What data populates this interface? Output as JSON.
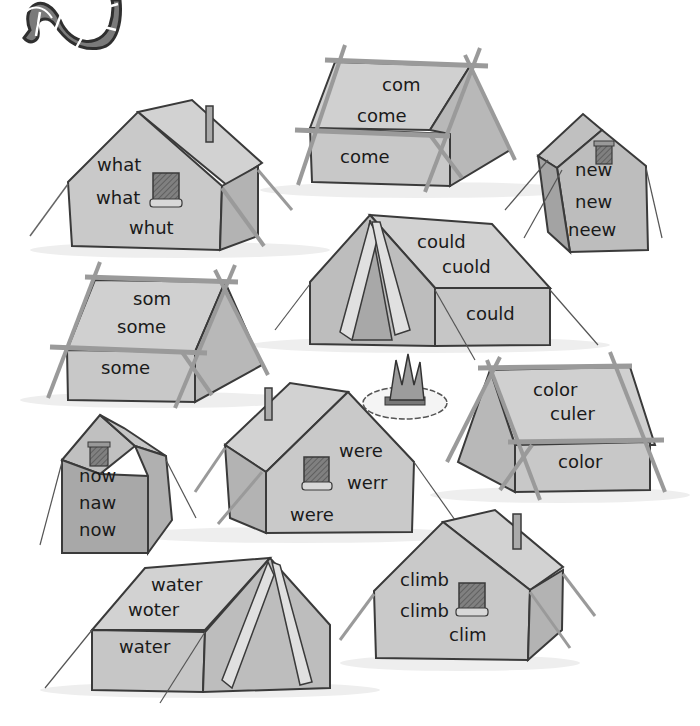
{
  "worksheet": {
    "decoration": "striped-worm",
    "campfire": "campfire-with-stone-ring",
    "tents": [
      {
        "id": "come",
        "style": "a-frame-poles",
        "words": [
          "com",
          "come",
          "come"
        ]
      },
      {
        "id": "what",
        "style": "cabin",
        "words": [
          "what",
          "what",
          "whut"
        ]
      },
      {
        "id": "new",
        "style": "pup",
        "words": [
          "new",
          "new",
          "neew"
        ]
      },
      {
        "id": "could",
        "style": "pyramid",
        "words": [
          "could",
          "cuold",
          "could"
        ]
      },
      {
        "id": "some",
        "style": "a-frame-poles",
        "words": [
          "som",
          "some",
          "some"
        ]
      },
      {
        "id": "color",
        "style": "a-frame-poles",
        "words": [
          "color",
          "culer",
          "color"
        ]
      },
      {
        "id": "now",
        "style": "pup",
        "words": [
          "now",
          "naw",
          "now"
        ]
      },
      {
        "id": "were",
        "style": "cabin",
        "words": [
          "were",
          "werr",
          "were"
        ]
      },
      {
        "id": "water",
        "style": "pyramid",
        "words": [
          "water",
          "woter",
          "water"
        ]
      },
      {
        "id": "climb",
        "style": "cabin",
        "words": [
          "climb",
          "climb",
          "clim"
        ]
      }
    ]
  },
  "colors": {
    "tent_fill": "#c9c9c9",
    "tent_side": "#a9a9a9",
    "tent_dark": "#8f8f8f",
    "outline": "#3a3a3a",
    "pole": "#b5b5b5",
    "worm": "#7a7a7a",
    "window": "#707070"
  }
}
